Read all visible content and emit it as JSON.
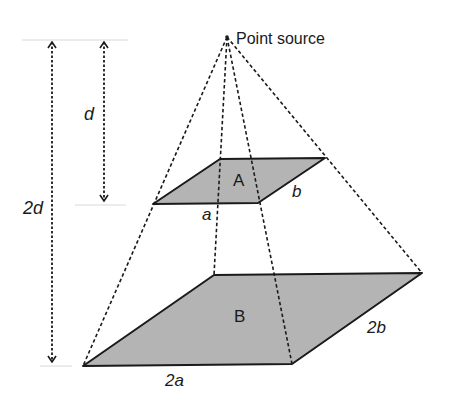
{
  "diagram": {
    "title_label": "Point source",
    "apex": {
      "x": 227,
      "y": 37
    },
    "fill_color": "#b4b4b4",
    "stroke_color": "#1a1a1a",
    "surface_A": {
      "label": "A",
      "edge_a_label": "a",
      "edge_b_label": "b",
      "corners": [
        [
          220,
          159
        ],
        [
          325,
          158
        ],
        [
          258,
          203
        ],
        [
          153,
          204
        ]
      ]
    },
    "surface_B": {
      "label": "B",
      "edge_a_label": "2a",
      "edge_b_label": "2b",
      "corners": [
        [
          214,
          275
        ],
        [
          422,
          273
        ],
        [
          292,
          364
        ],
        [
          83,
          366
        ]
      ]
    },
    "distance_d": {
      "label": "d",
      "x": 104,
      "y1": 40,
      "y2": 203
    },
    "distance_2d": {
      "label": "2d",
      "x": 52,
      "y1": 40,
      "y2": 364
    }
  }
}
